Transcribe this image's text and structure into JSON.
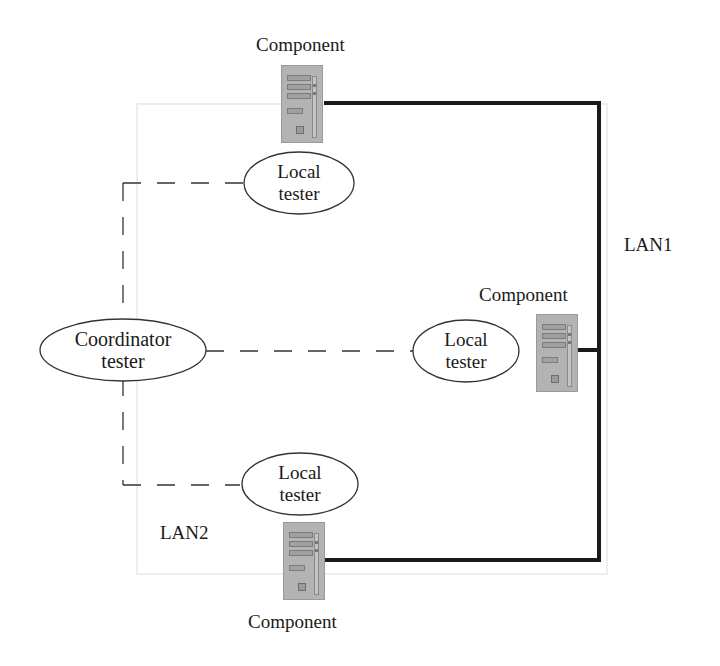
{
  "diagram": {
    "nodes": {
      "coordinator": {
        "line1": "Coordinator",
        "line2": "tester"
      },
      "local_top": {
        "line1": "Local",
        "line2": "tester"
      },
      "local_mid": {
        "line1": "Local",
        "line2": "tester"
      },
      "local_bottom": {
        "line1": "Local",
        "line2": "tester"
      }
    },
    "components": {
      "top": {
        "label": "Component",
        "icon": "computer-tower-icon"
      },
      "mid": {
        "label": "Component",
        "icon": "computer-tower-icon"
      },
      "bottom": {
        "label": "Component",
        "icon": "computer-tower-icon"
      }
    },
    "networks": {
      "lan1": "LAN1",
      "lan2": "LAN2"
    },
    "colors": {
      "lan_line": "#1a1a1a",
      "dashed_line": "#333333",
      "computer_fill": "#b3b3b3"
    }
  }
}
